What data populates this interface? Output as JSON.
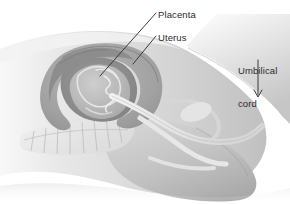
{
  "figure": {
    "background_color": "#ffffff",
    "width": 290,
    "height": 204,
    "style": "grayscale medical line-and-wash illustration"
  },
  "labels": {
    "placenta": {
      "text": "Placenta",
      "x": 158,
      "y": 9
    },
    "uterus": {
      "text": "Uterus",
      "x": 158,
      "y": 32
    },
    "umbilical_cord_line1": {
      "text": "Umbilical",
      "x": 238,
      "y": 43
    },
    "umbilical_cord_line2": {
      "text": "cord",
      "x": 238,
      "y": 54
    },
    "umbilical_cord_full": "Umbilical cord"
  },
  "leaders": [
    {
      "name": "placenta-leader",
      "from_x": 156,
      "from_y": 13,
      "to_x": 100,
      "to_y": 76
    },
    {
      "name": "uterus-leader",
      "from_x": 156,
      "from_y": 36,
      "to_x": 133,
      "to_y": 64
    },
    {
      "name": "cord-leader",
      "from_x": 258,
      "from_y": 60,
      "to_x": 258,
      "to_y": 97
    }
  ],
  "palette": {
    "ink": "#2b2b2b",
    "leader_line": "#3a3a3a",
    "body_light": "#e2e2e2",
    "body_mid": "#c9c9c9",
    "body_dark": "#ababab",
    "uterus_wall": "#9d9d9d",
    "uterine_cavity": "#8f8f8f",
    "fetus": "#b8b8b8",
    "cord_highlight": "#efefef",
    "spine_light": "#ebebeb",
    "outline": "#7d7d7d",
    "background": "#ffffff"
  },
  "structures": [
    {
      "name": "maternal-abdomen",
      "label_visible": false
    },
    {
      "name": "uterus",
      "label_visible": true
    },
    {
      "name": "placenta",
      "label_visible": true
    },
    {
      "name": "fetus",
      "label_visible": false
    },
    {
      "name": "umbilical-cord",
      "label_visible": true
    },
    {
      "name": "spine-vertebrae",
      "label_visible": false
    },
    {
      "name": "birth-canal",
      "label_visible": false
    },
    {
      "name": "maternal-thigh",
      "label_visible": false
    }
  ]
}
